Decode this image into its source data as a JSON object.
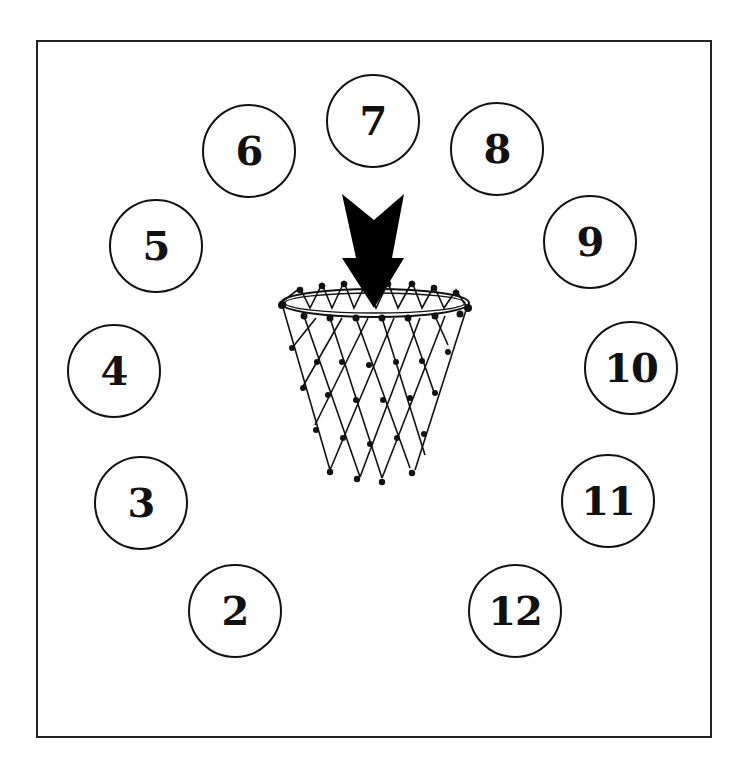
{
  "diagram": {
    "type": "basketball shooting spots drill",
    "frame": {
      "border_color": "#222222",
      "background": "#ffffff"
    },
    "center": {
      "element": "basketball hoop with net",
      "arrow": "downward arrow pointing into hoop"
    },
    "spots": [
      {
        "label": "2",
        "x": 234,
        "y": 610
      },
      {
        "label": "3",
        "x": 140,
        "y": 502
      },
      {
        "label": "4",
        "x": 113,
        "y": 370
      },
      {
        "label": "5",
        "x": 155,
        "y": 245
      },
      {
        "label": "6",
        "x": 248,
        "y": 150
      },
      {
        "label": "7",
        "x": 372,
        "y": 120
      },
      {
        "label": "8",
        "x": 496,
        "y": 148
      },
      {
        "label": "9",
        "x": 589,
        "y": 241
      },
      {
        "label": "10",
        "x": 630,
        "y": 367
      },
      {
        "label": "11",
        "x": 607,
        "y": 500
      },
      {
        "label": "12",
        "x": 514,
        "y": 610
      }
    ]
  }
}
